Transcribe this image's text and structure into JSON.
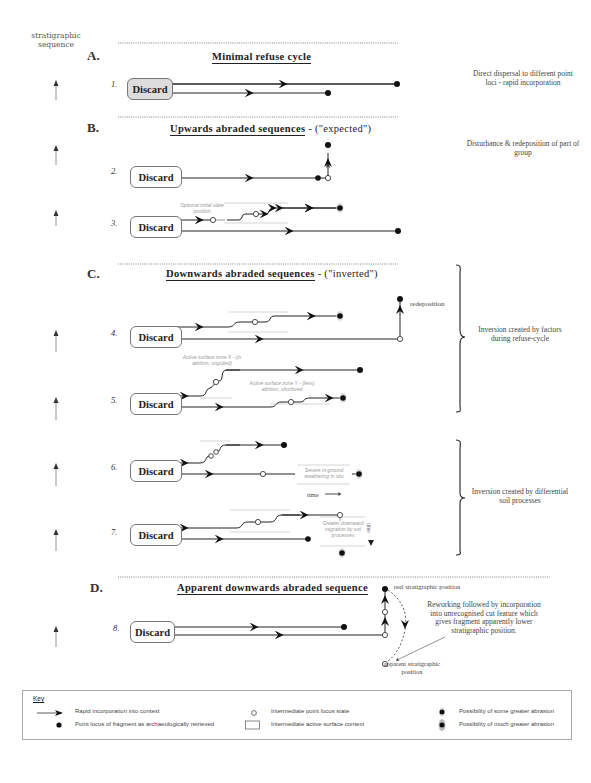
{
  "axis": {
    "label": "stratigraphic sequence"
  },
  "sections": [
    {
      "letter": "A.",
      "title": "Minimal refuse cycle",
      "qualifier": ""
    },
    {
      "letter": "B.",
      "title": "Upwards abraded sequences",
      "qualifier": " - (\"expected\")"
    },
    {
      "letter": "C.",
      "title": "Downwards abraded sequences",
      "qualifier": " - (\"inverted\")"
    },
    {
      "letter": "D.",
      "title": "Apparent downwards abraded sequence",
      "qualifier": ""
    }
  ],
  "rows": [
    {
      "num": "1.",
      "box": "Discard"
    },
    {
      "num": "2.",
      "box": "Discard"
    },
    {
      "num": "3.",
      "box": "Discard"
    },
    {
      "num": "4.",
      "box": "Discard"
    },
    {
      "num": "5.",
      "box": "Discard"
    },
    {
      "num": "6.",
      "box": "Discard"
    },
    {
      "num": "7.",
      "box": "Discard"
    },
    {
      "num": "8.",
      "box": "Discard"
    }
  ],
  "notes": {
    "a": "Direct dispersal to different point loci - rapid incorporation",
    "b": "Disturbance & redeposition of part of group",
    "c1": "Inversion created by factors during refuse-cycle",
    "c2": "Inversion created by differential soil processes",
    "d": "Reworking followed by incorporation into unrecognised cut feature which gives fragment apparently lower stratigraphic position."
  },
  "annotations": {
    "optional_initial": "Optional initial state position",
    "redeposition": "redeposition",
    "zone_x": "Active surface zone X - (in attrition, ungulled)",
    "zone_y": "Active surface zone Y - (less) attrition, shortlived",
    "severe_weathering": "Severe in-ground weathering in situ",
    "time": "time",
    "greater_migration": "Greater downward migration by soil processes",
    "time_vertical": "time",
    "real_position": "real stratigraphic position",
    "apparent_position": "apparent stratigraphic position"
  },
  "key": {
    "title": "Key",
    "items": [
      {
        "icon": "arrow-icon",
        "label": "Rapid incorporation into context"
      },
      {
        "icon": "filled-dot-icon",
        "label": "Point locus of fragment as archaeologically retrieved"
      },
      {
        "icon": "open-circle-icon",
        "label": "Intermediate point locus state"
      },
      {
        "icon": "rectangle-icon",
        "label": "Intermediate active surface context"
      },
      {
        "icon": "dot-some-abrasion-icon",
        "label": "Possibility of some greater abrasion"
      },
      {
        "icon": "dot-much-abrasion-icon",
        "label": "Possibility of much greater abrasion"
      }
    ]
  }
}
